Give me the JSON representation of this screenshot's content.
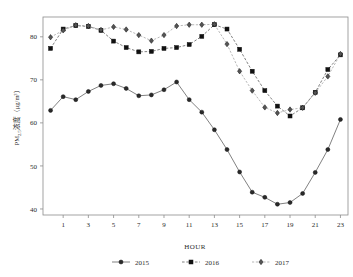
{
  "chart_data": {
    "type": "line",
    "title": "",
    "xlabel": "HOUR",
    "ylabel": "PM2.5浓度（μg/m³）",
    "ylabel_parts": {
      "prefix": "PM",
      "subscript": "2.5",
      "suffix": "浓度（μg/m³）"
    },
    "x": [
      0,
      1,
      2,
      3,
      4,
      5,
      6,
      7,
      8,
      9,
      10,
      11,
      12,
      13,
      14,
      15,
      16,
      17,
      18,
      19,
      20,
      21,
      22,
      23
    ],
    "xtick_labels": [
      "1",
      "3",
      "5",
      "7",
      "9",
      "11",
      "13",
      "15",
      "17",
      "19",
      "21",
      "23"
    ],
    "xtick_values": [
      1,
      3,
      5,
      7,
      9,
      11,
      13,
      15,
      17,
      19,
      21,
      23
    ],
    "ytick_labels": [
      "40",
      "50",
      "60",
      "70",
      "80"
    ],
    "ytick_values": [
      40,
      50,
      60,
      70,
      80
    ],
    "xlim": [
      -0.6,
      23.6
    ],
    "ylim": [
      38.6,
      84.6
    ],
    "grid": false,
    "legend_position": "bottom-center",
    "series": [
      {
        "name": "2015",
        "marker": "circle",
        "linestyle": "solid",
        "color": "#2a2a2a",
        "values": [
          62.9,
          66.1,
          65.4,
          67.3,
          68.7,
          69.1,
          68.0,
          66.3,
          66.5,
          67.7,
          69.5,
          65.4,
          62.5,
          58.4,
          53.8,
          48.6,
          43.9,
          42.7,
          41.1,
          41.5,
          43.6,
          48.5,
          53.8,
          60.8
        ]
      },
      {
        "name": "2016",
        "marker": "square",
        "linestyle": "dashed",
        "color": "#111111",
        "values": [
          77.3,
          81.8,
          82.6,
          82.4,
          81.5,
          79.0,
          77.5,
          76.5,
          76.6,
          77.3,
          77.5,
          78.2,
          80.1,
          82.8,
          81.8,
          77.1,
          72.0,
          67.5,
          63.9,
          61.6,
          63.5,
          67.1,
          72.4,
          75.8
        ]
      },
      {
        "name": "2017",
        "marker": "diamond",
        "linestyle": "dashed",
        "color": "#555555",
        "values": [
          79.9,
          81.5,
          82.7,
          82.5,
          81.6,
          82.3,
          81.7,
          80.4,
          79.1,
          80.4,
          82.5,
          82.8,
          82.8,
          82.9,
          78.3,
          72.0,
          67.5,
          63.6,
          62.3,
          63.1,
          63.5,
          67.0,
          70.8,
          76.0
        ]
      }
    ]
  },
  "legend": {
    "items": [
      {
        "label": "2015"
      },
      {
        "label": "2016"
      },
      {
        "label": "2017"
      }
    ]
  }
}
